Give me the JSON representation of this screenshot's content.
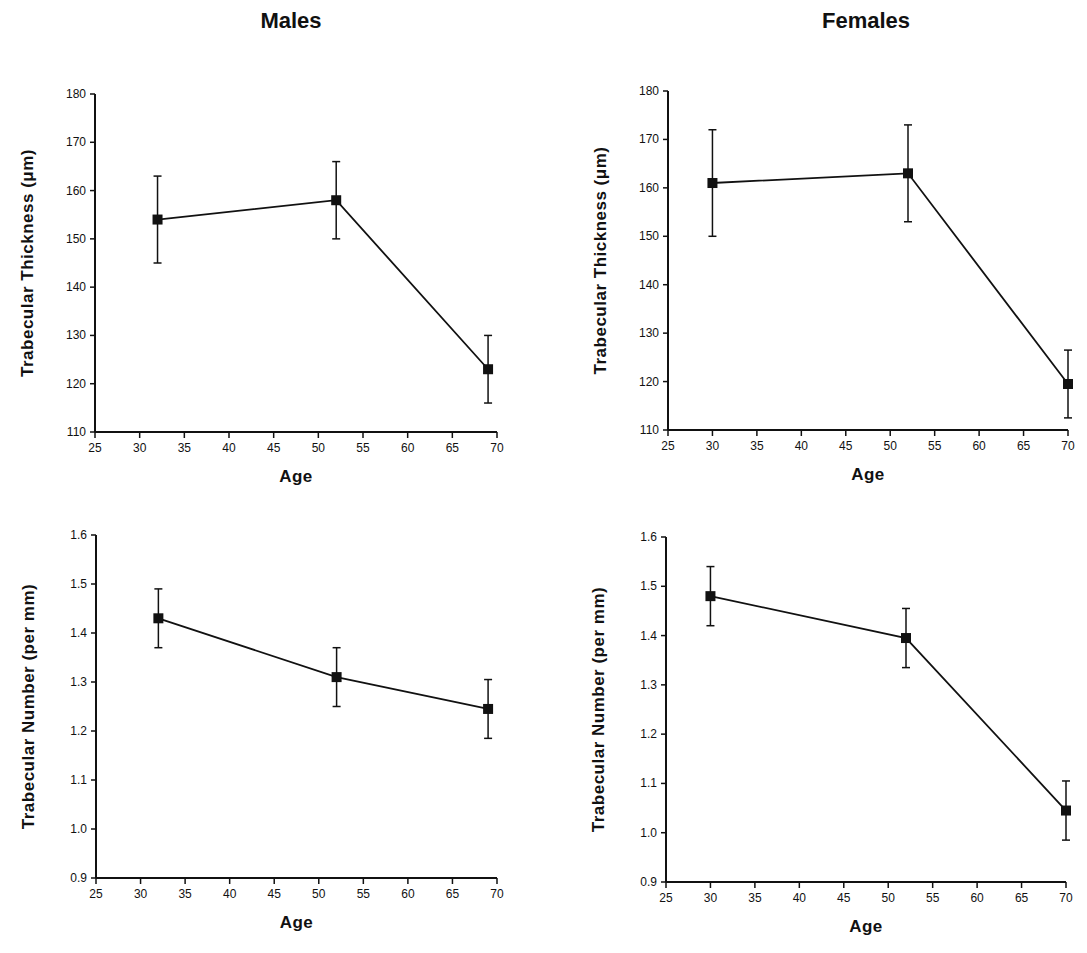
{
  "columns": {
    "left_title": "Males",
    "right_title": "Females"
  },
  "chart_data": [
    {
      "id": "males-thickness",
      "type": "line",
      "group": "Males",
      "title": "",
      "xlabel": "Age",
      "ylabel": "Trabecular Thickness (μm)",
      "xlim": [
        25,
        70
      ],
      "ylim": [
        110,
        180
      ],
      "xticks": [
        25,
        30,
        35,
        40,
        45,
        50,
        55,
        60,
        65,
        70
      ],
      "yticks": [
        110,
        120,
        130,
        140,
        150,
        160,
        170,
        180
      ],
      "x": [
        32,
        52,
        69
      ],
      "y": [
        154,
        158,
        123
      ],
      "error_low": [
        145,
        150,
        116
      ],
      "error_high": [
        163,
        166,
        130
      ],
      "grid": false,
      "legend": null
    },
    {
      "id": "females-thickness",
      "type": "line",
      "group": "Females",
      "title": "",
      "xlabel": "Age",
      "ylabel": "Trabecular Thickness (μm)",
      "xlim": [
        25,
        70
      ],
      "ylim": [
        110,
        180
      ],
      "xticks": [
        25,
        30,
        35,
        40,
        45,
        50,
        55,
        60,
        65,
        70
      ],
      "yticks": [
        110,
        120,
        130,
        140,
        150,
        160,
        170,
        180
      ],
      "x": [
        30,
        52,
        70
      ],
      "y": [
        161,
        163,
        119.5
      ],
      "error_low": [
        150,
        153,
        112.5
      ],
      "error_high": [
        172,
        173,
        126.5
      ],
      "grid": false,
      "legend": null
    },
    {
      "id": "males-number",
      "type": "line",
      "group": "Males",
      "title": "",
      "xlabel": "Age",
      "ylabel": "Trabecular Number (per mm)",
      "xlim": [
        25,
        70
      ],
      "ylim": [
        0.9,
        1.6
      ],
      "xticks": [
        25,
        30,
        35,
        40,
        45,
        50,
        55,
        60,
        65,
        70
      ],
      "yticks": [
        0.9,
        1.0,
        1.1,
        1.2,
        1.3,
        1.4,
        1.5,
        1.6
      ],
      "ytick_labels": [
        "0.9",
        "1.0",
        "1.1",
        "1.2",
        "1.3",
        "1.4",
        "1.5",
        "1.6"
      ],
      "x": [
        32,
        52,
        69
      ],
      "y": [
        1.43,
        1.31,
        1.245
      ],
      "error_low": [
        1.37,
        1.25,
        1.185
      ],
      "error_high": [
        1.49,
        1.37,
        1.305
      ],
      "grid": false,
      "legend": null
    },
    {
      "id": "females-number",
      "type": "line",
      "group": "Females",
      "title": "",
      "xlabel": "Age",
      "ylabel": "Trabecular Number (per mm)",
      "xlim": [
        25,
        70
      ],
      "ylim": [
        0.9,
        1.6
      ],
      "xticks": [
        25,
        30,
        35,
        40,
        45,
        50,
        55,
        60,
        65,
        70
      ],
      "yticks": [
        0.9,
        1.0,
        1.1,
        1.2,
        1.3,
        1.4,
        1.5,
        1.6
      ],
      "ytick_labels": [
        "0.9",
        "1.0",
        "1.1",
        "1.2",
        "1.3",
        "1.4",
        "1.5",
        "1.6"
      ],
      "x": [
        30,
        52,
        70
      ],
      "y": [
        1.48,
        1.395,
        1.045
      ],
      "error_low": [
        1.42,
        1.335,
        0.985
      ],
      "error_high": [
        1.54,
        1.455,
        1.105
      ],
      "grid": false,
      "legend": null
    }
  ],
  "style": {
    "line_color": "#111111",
    "marker_color": "#111111",
    "background": "#ffffff"
  }
}
